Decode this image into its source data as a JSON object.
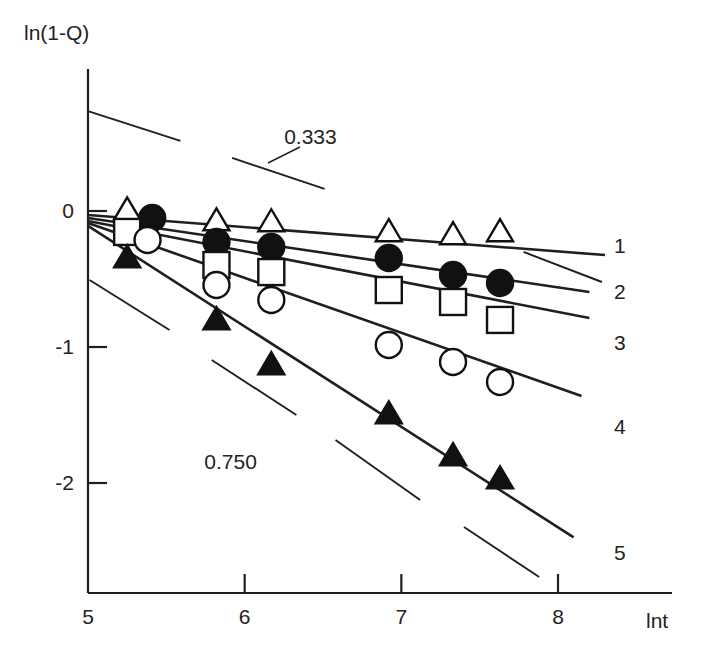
{
  "chart_data": {
    "type": "scatter",
    "title": "",
    "xlabel": "lnt",
    "ylabel": "ln(1-Q)",
    "xlim": [
      5,
      8.72
    ],
    "ylim": [
      -2.65,
      0.62
    ],
    "xticks": [
      5,
      6,
      7,
      8
    ],
    "yticks": [
      0,
      -1,
      -2
    ],
    "xticklabels": [
      "5",
      "6",
      "7",
      "8"
    ],
    "yticklabels": [
      "0",
      "-1",
      "-2"
    ],
    "grid": false,
    "legend_position": "right-of-line-ends",
    "annotations": [
      {
        "text": "0.333",
        "x": 6.42,
        "y": 0.49,
        "role": "slope-guide-label"
      },
      {
        "text": "0.750",
        "x": 5.91,
        "y": -1.9,
        "role": "slope-guide-label"
      }
    ],
    "slope_guides": [
      {
        "label": "0.333",
        "segments": [
          [
            [
              5.0,
              0.735
            ],
            [
              5.59,
              0.515
            ]
          ],
          [
            [
              5.92,
              0.39
            ],
            [
              6.51,
              0.162
            ]
          ]
        ]
      },
      {
        "label": "0.333",
        "segments": [
          [
            [
              7.78,
              -0.301
            ],
            [
              8.28,
              -0.522
            ]
          ]
        ]
      },
      {
        "label": "0.750",
        "segments": [
          [
            [
              5.01,
              -0.507
            ],
            [
              5.52,
              -0.875
            ]
          ],
          [
            [
              5.79,
              -1.096
            ],
            [
              6.33,
              -1.5
            ]
          ]
        ]
      },
      {
        "label": "0.750",
        "segments": [
          [
            [
              6.58,
              -1.684
            ],
            [
              7.12,
              -2.125
            ]
          ],
          [
            [
              7.4,
              -2.324
            ],
            [
              7.88,
              -2.691
            ]
          ]
        ]
      }
    ],
    "series": [
      {
        "name": "1",
        "label": "1",
        "marker": "open-triangle",
        "fit_line": [
          [
            5.0,
            -0.029
          ],
          [
            8.3,
            -0.324
          ]
        ],
        "points": [
          {
            "x": 5.25,
            "y": 0.007
          },
          {
            "x": 5.82,
            "y": -0.074
          },
          {
            "x": 6.17,
            "y": -0.081
          },
          {
            "x": 6.92,
            "y": -0.154
          },
          {
            "x": 7.33,
            "y": -0.176
          },
          {
            "x": 7.63,
            "y": -0.154
          }
        ]
      },
      {
        "name": "2",
        "label": "2",
        "marker": "filled-circle",
        "fit_line": [
          [
            5.0,
            -0.051
          ],
          [
            8.2,
            -0.596
          ]
        ],
        "points": [
          {
            "x": 5.41,
            "y": -0.051
          },
          {
            "x": 5.82,
            "y": -0.228
          },
          {
            "x": 6.17,
            "y": -0.265
          },
          {
            "x": 6.92,
            "y": -0.346
          },
          {
            "x": 7.33,
            "y": -0.471
          },
          {
            "x": 7.63,
            "y": -0.529
          }
        ]
      },
      {
        "name": "3",
        "label": "3",
        "marker": "open-square",
        "fit_line": [
          [
            5.0,
            -0.073
          ],
          [
            8.2,
            -0.787
          ]
        ],
        "points": [
          {
            "x": 5.25,
            "y": -0.154
          },
          {
            "x": 5.82,
            "y": -0.397
          },
          {
            "x": 6.17,
            "y": -0.449
          },
          {
            "x": 6.92,
            "y": -0.581
          },
          {
            "x": 7.33,
            "y": -0.669
          },
          {
            "x": 7.63,
            "y": -0.801
          }
        ]
      },
      {
        "name": "4",
        "label": "4",
        "marker": "open-circle",
        "fit_line": [
          [
            5.0,
            -0.088
          ],
          [
            8.15,
            -1.36
          ]
        ],
        "points": [
          {
            "x": 5.38,
            "y": -0.213
          },
          {
            "x": 5.82,
            "y": -0.544
          },
          {
            "x": 6.17,
            "y": -0.654
          },
          {
            "x": 6.92,
            "y": -0.985
          },
          {
            "x": 7.33,
            "y": -1.11
          },
          {
            "x": 7.63,
            "y": -1.257
          }
        ]
      },
      {
        "name": "5",
        "label": "5",
        "marker": "filled-triangle",
        "fit_line": [
          [
            5.0,
            -0.11
          ],
          [
            8.1,
            -2.4
          ]
        ],
        "points": [
          {
            "x": 5.25,
            "y": -0.346
          },
          {
            "x": 5.82,
            "y": -0.801
          },
          {
            "x": 6.17,
            "y": -1.132
          },
          {
            "x": 6.92,
            "y": -1.493
          },
          {
            "x": 7.33,
            "y": -1.801
          },
          {
            "x": 7.63,
            "y": -1.971
          }
        ]
      }
    ]
  },
  "axis": {
    "y_label_text": "ln(1-Q)",
    "x_label_text": "lnt"
  },
  "colors": {
    "ink": "#1f1f1f",
    "marker_fill": "#111111",
    "marker_open": "#ffffff",
    "background": "#ffffff"
  }
}
